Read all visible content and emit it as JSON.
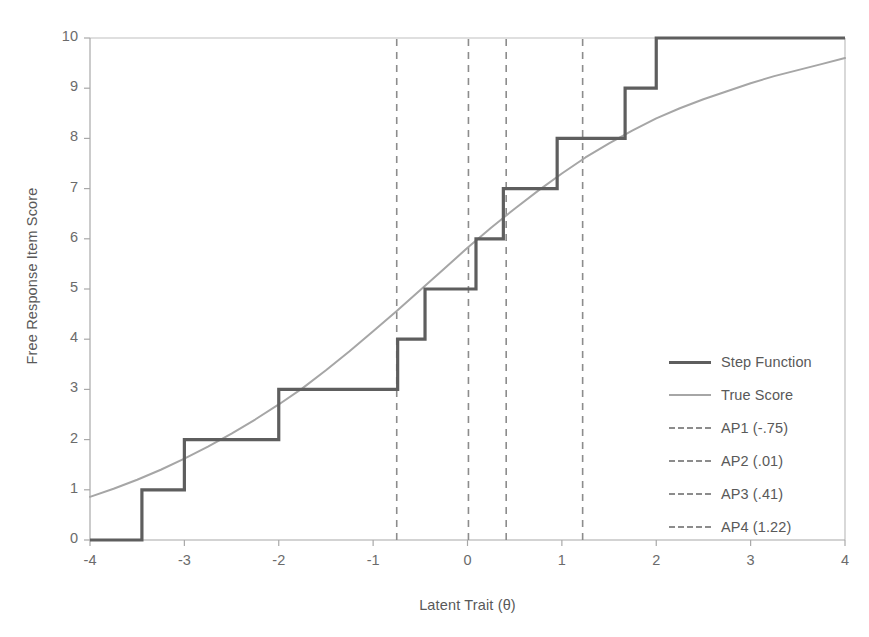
{
  "chart_data": {
    "type": "line",
    "title": "",
    "xlabel": "Latent Trait (θ)",
    "ylabel": "Free Response Item Score",
    "xlim": [
      -4,
      4
    ],
    "ylim": [
      0,
      10
    ],
    "xticks": [
      "-4",
      "-3",
      "-2",
      "-1",
      "0",
      "1",
      "2",
      "3",
      "4"
    ],
    "xtick_values": [
      -4,
      -3,
      -2,
      -1,
      0,
      1,
      2,
      3,
      4
    ],
    "yticks": [
      "0",
      "1",
      "2",
      "3",
      "4",
      "5",
      "6",
      "7",
      "8",
      "9",
      "10"
    ],
    "ytick_values": [
      0,
      1,
      2,
      3,
      4,
      5,
      6,
      7,
      8,
      9,
      10
    ],
    "grid": false,
    "legend_position": "center-right",
    "series": [
      {
        "name": "Step Function",
        "type": "step",
        "color": "#5e5e5e",
        "width": 3.2,
        "style": "solid",
        "step_thresholds": [
          -3.45,
          -3.0,
          -2.0,
          -0.74,
          -0.45,
          0.09,
          0.38,
          0.95,
          1.67,
          2.0
        ],
        "step_levels": [
          0,
          1,
          2,
          3,
          4,
          5,
          6,
          7,
          8,
          9,
          10
        ]
      },
      {
        "name": "True Score",
        "type": "line",
        "color": "#a6a6a6",
        "width": 2,
        "style": "solid",
        "x": [
          -4.0,
          -3.75,
          -3.5,
          -3.25,
          -3.0,
          -2.75,
          -2.5,
          -2.25,
          -2.0,
          -1.75,
          -1.5,
          -1.25,
          -1.0,
          -0.75,
          -0.5,
          -0.25,
          0.0,
          0.25,
          0.5,
          0.75,
          1.0,
          1.25,
          1.5,
          1.75,
          2.0,
          2.25,
          2.5,
          2.75,
          3.0,
          3.25,
          3.5,
          3.75,
          4.0
        ],
        "y": [
          0.86,
          1.02,
          1.2,
          1.4,
          1.62,
          1.86,
          2.12,
          2.4,
          2.7,
          3.02,
          3.38,
          3.76,
          4.16,
          4.56,
          4.98,
          5.4,
          5.82,
          6.22,
          6.6,
          6.96,
          7.3,
          7.62,
          7.9,
          8.16,
          8.4,
          8.6,
          8.78,
          8.94,
          9.1,
          9.24,
          9.36,
          9.48,
          9.6
        ]
      }
    ],
    "vertical_markers": [
      {
        "name": "AP1",
        "label": "AP1 (-.75)",
        "value": -0.75,
        "color": "#8c8c8c",
        "style": "dashed"
      },
      {
        "name": "AP2",
        "label": "AP2 (.01)",
        "value": 0.01,
        "color": "#8c8c8c",
        "style": "dashed"
      },
      {
        "name": "AP3",
        "label": "AP3 (.41)",
        "value": 0.41,
        "color": "#8c8c8c",
        "style": "dashed"
      },
      {
        "name": "AP4",
        "label": "AP4 (1.22)",
        "value": 1.22,
        "color": "#8c8c8c",
        "style": "dashed"
      }
    ],
    "legend_entries": [
      {
        "label": "Step Function",
        "key": "solid-thick",
        "color": "#5e5e5e"
      },
      {
        "label": "True Score",
        "key": "solid-thin",
        "color": "#a6a6a6"
      },
      {
        "label": "AP1 (-.75)",
        "key": "dashed",
        "color": "#8c8c8c"
      },
      {
        "label": "AP2 (.01)",
        "key": "dashed",
        "color": "#8c8c8c"
      },
      {
        "label": "AP3 (.41)",
        "key": "dashed",
        "color": "#8c8c8c"
      },
      {
        "label": "AP4 (1.22)",
        "key": "dashed",
        "color": "#8c8c8c"
      }
    ]
  },
  "figure": {
    "title_partial": "",
    "axis_color": "#b3b3b3",
    "text_color": "#595959"
  }
}
